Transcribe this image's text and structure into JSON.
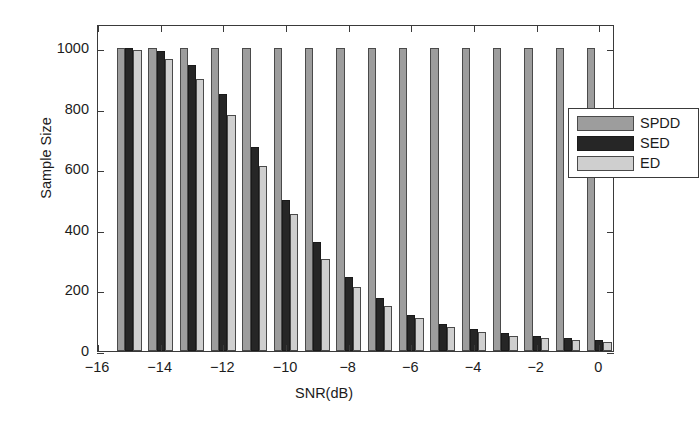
{
  "chart_data": {
    "type": "bar",
    "title": "",
    "xlabel": "SNR(dB)",
    "ylabel": "Sample Size",
    "xlim": [
      -16,
      0.5
    ],
    "ylim": [
      0,
      1080
    ],
    "grid": false,
    "legend_position": "upper right",
    "x": [
      -15,
      -14,
      -13,
      -12,
      -11,
      -10,
      -9,
      -8,
      -7,
      -6,
      -5,
      -4,
      -3,
      -2,
      -1,
      0
    ],
    "categories": [
      "-15",
      "-14",
      "-13",
      "-12",
      "-11",
      "-10",
      "-9",
      "-8",
      "-7",
      "-6",
      "-5",
      "-4",
      "-3",
      "-2",
      "-1",
      "0"
    ],
    "series": [
      {
        "name": "SPDD",
        "color": "#9d9d9d",
        "values": [
          1000,
          1000,
          1000,
          1000,
          1000,
          1000,
          1000,
          1000,
          1000,
          1000,
          1000,
          1000,
          1000,
          1000,
          1000,
          1000
        ]
      },
      {
        "name": "SED",
        "color": "#262626",
        "values": [
          1000,
          990,
          945,
          850,
          675,
          500,
          360,
          245,
          175,
          120,
          90,
          72,
          60,
          50,
          42,
          38
        ]
      },
      {
        "name": "ED",
        "color": "#cfcfcf",
        "values": [
          995,
          965,
          898,
          778,
          610,
          452,
          305,
          212,
          150,
          110,
          80,
          62,
          50,
          42,
          35,
          30
        ]
      }
    ],
    "yticks": [
      0,
      200,
      400,
      600,
      800,
      1000
    ],
    "ytick_labels": [
      "0",
      "200",
      "400",
      "600",
      "800",
      "1000"
    ],
    "xticks": [
      -16,
      -14,
      -12,
      -10,
      -8,
      -6,
      -4,
      -2,
      0
    ],
    "xtick_labels": [
      "−16",
      "−14",
      "−12",
      "−10",
      "−8",
      "−6",
      "−4",
      "−2",
      "0"
    ]
  },
  "legend": {
    "entries": [
      {
        "label": "SPDD"
      },
      {
        "label": "SED"
      },
      {
        "label": "ED"
      }
    ]
  },
  "axes": {
    "x_title": "SNR(dB)",
    "y_title": "Sample Size"
  }
}
